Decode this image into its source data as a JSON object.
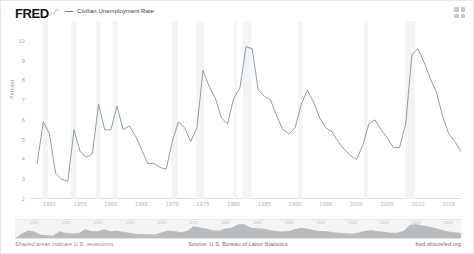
{
  "header": {
    "logo": "FRED",
    "logo_icon": "mini-line-chart-icon",
    "legend_label": "Civilian Unemployment Rate",
    "grid_icon": "four-squares-grid-icon"
  },
  "footer": {
    "note": "Shaded areas indicate U.S. recessions",
    "source": "Source: U.S. Bureau of Labor Statistics",
    "url": "fred.stlouisfed.org"
  },
  "colors": {
    "line": "#7b8b96",
    "recession_band": "#f2f4f6",
    "navigator_bg": "#f4f4f4",
    "navigator_area": "#b7bcc0",
    "axis": "#dcdcdc",
    "tick_text": "#a8a8a8"
  },
  "chart_data": {
    "type": "line",
    "title": "Civilian Unemployment Rate",
    "xlabel": "",
    "ylabel": "Percent",
    "xlim": [
      1947,
      2017
    ],
    "ylim": [
      2,
      11
    ],
    "grid": false,
    "legend_position": "top-left",
    "yticks": [
      10,
      9,
      8,
      7,
      6,
      5,
      4,
      3,
      2
    ],
    "xticks": [
      1950,
      1955,
      1960,
      1965,
      1970,
      1975,
      1980,
      1985,
      1990,
      1995,
      2000,
      2005,
      2010,
      2015
    ],
    "series": [
      {
        "name": "Civilian Unemployment Rate",
        "x": [
          1948,
          1949,
          1950,
          1951,
          1952,
          1953,
          1954,
          1955,
          1956,
          1957,
          1958,
          1959,
          1960,
          1961,
          1962,
          1963,
          1964,
          1965,
          1966,
          1967,
          1968,
          1969,
          1970,
          1971,
          1972,
          1973,
          1974,
          1975,
          1976,
          1977,
          1978,
          1979,
          1980,
          1981,
          1982,
          1983,
          1984,
          1985,
          1986,
          1987,
          1988,
          1989,
          1990,
          1991,
          1992,
          1993,
          1994,
          1995,
          1996,
          1997,
          1998,
          1999,
          2000,
          2001,
          2002,
          2003,
          2004,
          2005,
          2006,
          2007,
          2008,
          2009,
          2010,
          2011,
          2012,
          2013,
          2014,
          2015,
          2016,
          2017
        ],
        "values": [
          3.8,
          5.9,
          5.3,
          3.3,
          3.0,
          2.9,
          5.5,
          4.4,
          4.1,
          4.3,
          6.8,
          5.5,
          5.5,
          6.7,
          5.5,
          5.7,
          5.2,
          4.5,
          3.8,
          3.8,
          3.6,
          3.5,
          4.9,
          5.9,
          5.6,
          4.9,
          5.6,
          8.5,
          7.7,
          7.1,
          6.1,
          5.8,
          7.1,
          7.6,
          9.7,
          9.6,
          7.5,
          7.2,
          7.0,
          6.2,
          5.5,
          5.3,
          5.6,
          6.8,
          7.5,
          6.9,
          6.1,
          5.6,
          5.4,
          4.9,
          4.5,
          4.2,
          4.0,
          4.7,
          5.8,
          6.0,
          5.5,
          5.1,
          4.6,
          4.6,
          5.8,
          9.3,
          9.6,
          8.9,
          8.1,
          7.4,
          6.2,
          5.3,
          4.9,
          4.4
        ]
      }
    ],
    "recessions": [
      {
        "start": 1948.9,
        "end": 1949.8
      },
      {
        "start": 1953.5,
        "end": 1954.4
      },
      {
        "start": 1957.6,
        "end": 1958.3
      },
      {
        "start": 1960.3,
        "end": 1961.1
      },
      {
        "start": 1969.9,
        "end": 1970.9
      },
      {
        "start": 1973.9,
        "end": 1975.2
      },
      {
        "start": 1980.0,
        "end": 1980.5
      },
      {
        "start": 1981.5,
        "end": 1982.9
      },
      {
        "start": 1990.5,
        "end": 1991.2
      },
      {
        "start": 2001.2,
        "end": 2001.8
      },
      {
        "start": 2007.9,
        "end": 2009.5
      }
    ]
  }
}
